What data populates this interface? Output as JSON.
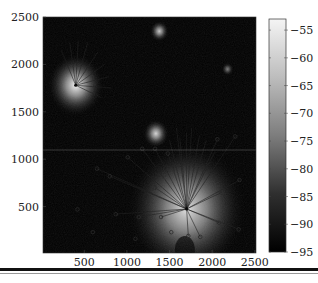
{
  "chart_data": {
    "type": "heatmap",
    "title": "",
    "xlabel": "",
    "ylabel": "",
    "xlim": [
      20,
      2500
    ],
    "ylim": [
      20,
      2500
    ],
    "x_ticks": [
      500,
      1000,
      1500,
      2000,
      2500
    ],
    "y_ticks": [
      500,
      1000,
      1500,
      2000,
      2500
    ],
    "grid": false,
    "colormap": "gray",
    "colorbar": {
      "position": "right",
      "range": [
        -95,
        -53
      ],
      "ticks": [
        -55,
        -60,
        -65,
        -70,
        -75,
        -80,
        -85,
        -90,
        -95
      ]
    },
    "hotspots": [
      {
        "name": "hub-top-left",
        "x": 400,
        "y": 1780,
        "peak": -55,
        "radius": 330
      },
      {
        "name": "hub-center",
        "x": 1700,
        "y": 475,
        "peak": -58,
        "radius": 700
      },
      {
        "name": "blob-top",
        "x": 1380,
        "y": 2350,
        "peak": -62,
        "radius": 110
      },
      {
        "name": "blob-mid",
        "x": 1340,
        "y": 1270,
        "peak": -60,
        "radius": 150
      },
      {
        "name": "blob-right",
        "x": 2180,
        "y": 1950,
        "peak": -75,
        "radius": 70
      }
    ],
    "links": [
      {
        "hub": [
          400,
          1780
        ],
        "targets": [
          [
            230,
            2150
          ],
          [
            330,
            2230
          ],
          [
            430,
            2250
          ],
          [
            540,
            2230
          ],
          [
            660,
            2130
          ],
          [
            740,
            2000
          ],
          [
            790,
            1870
          ],
          [
            820,
            1750
          ],
          [
            700,
            1650
          ]
        ]
      },
      {
        "hub": [
          1700,
          475
        ],
        "targets": [
          [
            1500,
            1200
          ],
          [
            1580,
            1330
          ],
          [
            1620,
            1230
          ],
          [
            1700,
            1280
          ],
          [
            1760,
            1330
          ],
          [
            1850,
            1250
          ],
          [
            1930,
            1200
          ],
          [
            2030,
            1080
          ],
          [
            2270,
            1240
          ],
          [
            2060,
            1210
          ],
          [
            2320,
            780
          ],
          [
            2110,
            650
          ],
          [
            2310,
            260
          ],
          [
            2080,
            330
          ],
          [
            1860,
            180
          ],
          [
            1720,
            190
          ],
          [
            1400,
            390
          ],
          [
            1140,
            390
          ],
          [
            870,
            420
          ],
          [
            1330,
            700
          ],
          [
            1180,
            1110
          ],
          [
            1010,
            1020
          ],
          [
            1330,
            1110
          ],
          [
            1480,
            1060
          ],
          [
            800,
            820
          ],
          [
            650,
            900
          ]
        ]
      }
    ],
    "markers": [
      [
        1180,
        1110
      ],
      [
        1330,
        1110
      ],
      [
        1480,
        1060
      ],
      [
        1010,
        1020
      ],
      [
        1330,
        700
      ],
      [
        800,
        820
      ],
      [
        1140,
        390
      ],
      [
        870,
        420
      ],
      [
        1400,
        390
      ],
      [
        1720,
        190
      ],
      [
        1860,
        180
      ],
      [
        2080,
        330
      ],
      [
        2310,
        260
      ],
      [
        2110,
        650
      ],
      [
        2320,
        780
      ],
      [
        2060,
        1210
      ],
      [
        2270,
        1240
      ],
      [
        650,
        900
      ],
      [
        600,
        230
      ],
      [
        420,
        470
      ],
      [
        1100,
        160
      ],
      [
        1520,
        230
      ]
    ]
  },
  "axes": {
    "x_tick_labels": [
      "500",
      "1000",
      "1500",
      "2000",
      "2500"
    ],
    "y_tick_labels": [
      "2500",
      "2000",
      "1500",
      "1000",
      "500"
    ],
    "colorbar_tick_labels": [
      "-55",
      "-60",
      "-65",
      "-70",
      "-75",
      "-80",
      "-85",
      "-90",
      "-95"
    ]
  }
}
